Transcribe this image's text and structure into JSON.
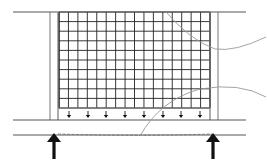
{
  "diagram": {
    "colors": {
      "line": "#555555",
      "grid": "#222222",
      "wall": "#777777",
      "leader": "#999999",
      "arrow": "#111111",
      "dashed": "#777777"
    },
    "grid": {
      "x": 59,
      "y": 12,
      "width": 151,
      "height": 96,
      "columns": 16,
      "rows": 10
    },
    "top_line": {
      "x1": 13,
      "x2": 246,
      "y": 12
    },
    "left_wall": {
      "outer_x": 50,
      "inner_x": 58,
      "y1": 12,
      "y2": 120
    },
    "right_wall": {
      "inner_x": 210,
      "outer_x": 218,
      "y1": 12,
      "y2": 120
    },
    "rail": {
      "top_y": 120,
      "bottom_y": 135,
      "x1": 13,
      "x2": 246
    },
    "load_arrows": {
      "y1": 111,
      "y2": 118,
      "x": [
        69,
        88,
        106,
        125,
        144,
        163,
        181,
        200
      ]
    },
    "support_arrows": [
      {
        "x": 54,
        "y_top": 133,
        "y_bottom": 159
      },
      {
        "x": 213,
        "y_top": 133,
        "y_bottom": 159
      }
    ],
    "deflection_line": {
      "x1": 58,
      "x2": 212,
      "y": 134,
      "style": "dashed"
    },
    "leaders": [
      {
        "name": "leader-upper",
        "path": "M 166 12 Q 190 40 215 49 Q 235 52 266 37"
      },
      {
        "name": "leader-lower",
        "path": "M 140 136 Q 160 100 200 89 Q 240 82 266 97"
      }
    ]
  }
}
